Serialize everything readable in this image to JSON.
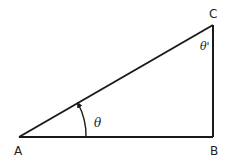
{
  "diagram": {
    "type": "right-triangle",
    "vertices": {
      "A": {
        "label": "A"
      },
      "B": {
        "label": "B"
      },
      "C": {
        "label": "C"
      }
    },
    "angles": {
      "at_A": {
        "label": "θ"
      },
      "at_C": {
        "label": "θ'"
      }
    },
    "colors": {
      "stroke": "#1a1a1a",
      "background": "#ffffff"
    }
  }
}
